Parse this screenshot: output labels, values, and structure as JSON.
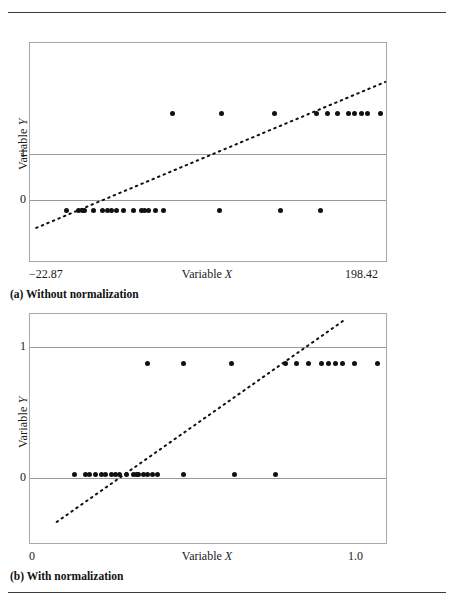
{
  "figure": {
    "top_rule": true,
    "bottom_rule": true
  },
  "panels": [
    {
      "id": "panel-a",
      "caption": "(a) Without normalization",
      "xlabel": "Variable X",
      "ylabel": "Variable Y",
      "xtick_left": "−22.87",
      "xtick_right": "198.42",
      "ytick_top": "1",
      "ytick_bottom": "0"
    },
    {
      "id": "panel-b",
      "caption": "(b) With normalization",
      "xlabel": "Variable X",
      "ylabel": "Variable Y",
      "xtick_left": "0",
      "xtick_right": "1.0",
      "ytick_top": "1",
      "ytick_bottom": "0"
    }
  ],
  "chart_data": [
    {
      "type": "scatter",
      "title": "(a) Without normalization",
      "xlabel": "Variable X",
      "ylabel": "Variable Y",
      "xlim": [
        -22.87,
        198.42
      ],
      "ylim": [
        -0.52,
        1.72
      ],
      "yticks": [
        0,
        1
      ],
      "ytick_labels": [
        "0",
        "1"
      ],
      "xticks": [
        -22.87,
        198.42
      ],
      "xtick_labels": [
        "−22.87",
        "198.42"
      ],
      "grid": "horizontal-at-y0-and-y1",
      "legend": "none",
      "points": [
        {
          "x": 0.0,
          "y": 0
        },
        {
          "x": 7.5,
          "y": 0
        },
        {
          "x": 9.5,
          "y": 0
        },
        {
          "x": 11.0,
          "y": 0
        },
        {
          "x": 16.5,
          "y": 0
        },
        {
          "x": 22.0,
          "y": 0
        },
        {
          "x": 25.5,
          "y": 0
        },
        {
          "x": 27.5,
          "y": 0
        },
        {
          "x": 31.0,
          "y": 0
        },
        {
          "x": 35.5,
          "y": 0
        },
        {
          "x": 41.5,
          "y": 0
        },
        {
          "x": 46.5,
          "y": 0
        },
        {
          "x": 48.5,
          "y": 0
        },
        {
          "x": 50.5,
          "y": 0
        },
        {
          "x": 55.0,
          "y": 0
        },
        {
          "x": 60.0,
          "y": 0
        },
        {
          "x": 95.0,
          "y": 0
        },
        {
          "x": 133.0,
          "y": 0
        },
        {
          "x": 158.0,
          "y": 0
        },
        {
          "x": 66.0,
          "y": 1
        },
        {
          "x": 96.0,
          "y": 1
        },
        {
          "x": 129.0,
          "y": 1
        },
        {
          "x": 155.0,
          "y": 1
        },
        {
          "x": 162.0,
          "y": 1
        },
        {
          "x": 168.0,
          "y": 1
        },
        {
          "x": 175.0,
          "y": 1
        },
        {
          "x": 179.0,
          "y": 1
        },
        {
          "x": 183.0,
          "y": 1
        },
        {
          "x": 187.0,
          "y": 1
        },
        {
          "x": 195.0,
          "y": 1
        }
      ],
      "trend_line": {
        "style": "dotted",
        "x0": -19.0,
        "y0": -0.18,
        "x1": 198.0,
        "y1": 1.32
      }
    },
    {
      "type": "scatter",
      "title": "(b) With normalization",
      "xlabel": "Variable X",
      "ylabel": "Variable Y",
      "xlim": [
        0.0,
        1.0
      ],
      "ylim": [
        -0.62,
        1.45
      ],
      "yticks": [
        0,
        1
      ],
      "ytick_labels": [
        "0",
        "1"
      ],
      "xticks": [
        0.0,
        1.0
      ],
      "xtick_labels": [
        "0",
        "1.0"
      ],
      "grid": "horizontal-at-y0-and-y1",
      "legend": "none",
      "points": [
        {
          "x": 0.125,
          "y": 0
        },
        {
          "x": 0.155,
          "y": 0
        },
        {
          "x": 0.168,
          "y": 0
        },
        {
          "x": 0.185,
          "y": 0
        },
        {
          "x": 0.2,
          "y": 0
        },
        {
          "x": 0.212,
          "y": 0
        },
        {
          "x": 0.228,
          "y": 0
        },
        {
          "x": 0.24,
          "y": 0
        },
        {
          "x": 0.252,
          "y": 0
        },
        {
          "x": 0.272,
          "y": 0
        },
        {
          "x": 0.29,
          "y": 0
        },
        {
          "x": 0.298,
          "y": 0
        },
        {
          "x": 0.305,
          "y": 0
        },
        {
          "x": 0.318,
          "y": 0
        },
        {
          "x": 0.33,
          "y": 0
        },
        {
          "x": 0.345,
          "y": 0
        },
        {
          "x": 0.358,
          "y": 0
        },
        {
          "x": 0.43,
          "y": 0
        },
        {
          "x": 0.575,
          "y": 0
        },
        {
          "x": 0.69,
          "y": 0
        },
        {
          "x": 0.33,
          "y": 1
        },
        {
          "x": 0.43,
          "y": 1
        },
        {
          "x": 0.565,
          "y": 1
        },
        {
          "x": 0.718,
          "y": 1
        },
        {
          "x": 0.748,
          "y": 1
        },
        {
          "x": 0.782,
          "y": 1
        },
        {
          "x": 0.818,
          "y": 1
        },
        {
          "x": 0.838,
          "y": 1
        },
        {
          "x": 0.858,
          "y": 1
        },
        {
          "x": 0.878,
          "y": 1
        },
        {
          "x": 0.912,
          "y": 1
        },
        {
          "x": 0.975,
          "y": 1
        }
      ],
      "trend_line": {
        "style": "dotted",
        "x0": 0.075,
        "y0": -0.43,
        "x1": 0.885,
        "y1": 1.4
      }
    }
  ]
}
